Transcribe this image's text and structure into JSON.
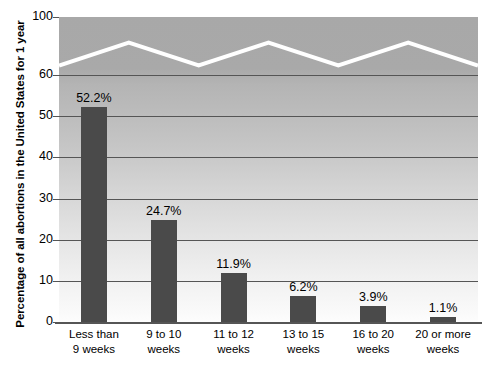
{
  "chart_data": {
    "type": "bar",
    "title": "",
    "xlabel": "",
    "ylabel": "Percentage of all abortions in the United States for 1 year",
    "categories": [
      "Less than\n9 weeks",
      "9 to 10\nweeks",
      "11 to 12\nweeks",
      "13 to 15\nweeks",
      "16 to 20\nweeks",
      "20 or more\nweeks"
    ],
    "category_lines": [
      [
        "Less than",
        "9 weeks"
      ],
      [
        "9 to 10",
        "weeks"
      ],
      [
        "11 to 12",
        "weeks"
      ],
      [
        "13 to 15",
        "weeks"
      ],
      [
        "16 to 20",
        "weeks"
      ],
      [
        "20 or more",
        "weeks"
      ]
    ],
    "values": [
      52.2,
      24.7,
      11.9,
      6.2,
      3.9,
      1.1
    ],
    "value_labels": [
      "52.2%",
      "24.7%",
      "11.9%",
      "6.2%",
      "3.9%",
      "1.1%"
    ],
    "ytick_labels": [
      "0",
      "10",
      "20",
      "30",
      "40",
      "50",
      "60",
      "100"
    ],
    "ytick_values": [
      0,
      10,
      20,
      30,
      40,
      50,
      60,
      100
    ],
    "ylim": [
      0,
      100
    ],
    "axis_break": true,
    "axis_break_note": "Y axis is broken between 60 and 100; white zigzag marks the break.",
    "grid": true,
    "grid_orientation": "horizontal",
    "legend": "none",
    "colors": {
      "bar": "#4a4a4a",
      "gridline": "#555555",
      "axis": "#555555",
      "break_marker": "#ffffff",
      "plot_background_top": "#a8a8a8",
      "plot_background_bottom": "#fdfdfd",
      "page_background": "#ffffff",
      "text": "#000000"
    }
  }
}
